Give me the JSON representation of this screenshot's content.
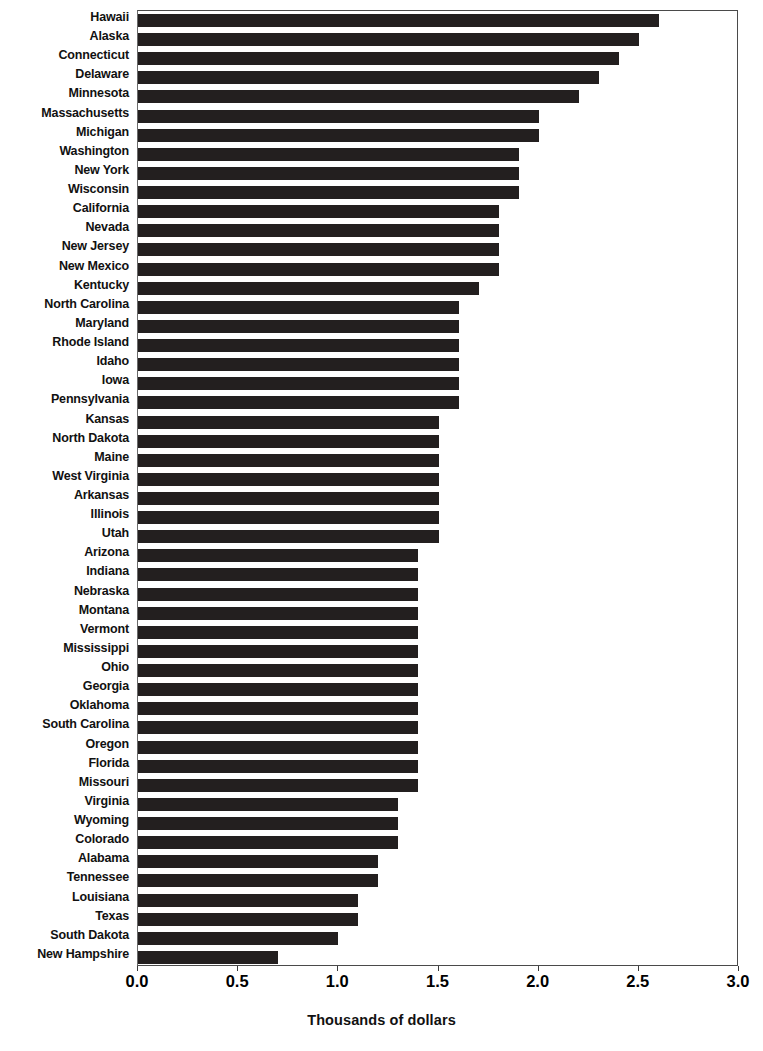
{
  "chart_data": {
    "type": "bar",
    "orientation": "horizontal",
    "title": "",
    "xlabel": "Thousands of dollars",
    "ylabel": "",
    "xlim": [
      0.0,
      3.0
    ],
    "xticks": [
      "0.0",
      "0.5",
      "1.0",
      "1.5",
      "2.0",
      "2.5",
      "3.0"
    ],
    "xtick_values": [
      0.0,
      0.5,
      1.0,
      1.5,
      2.0,
      2.5,
      3.0
    ],
    "grid": false,
    "legend": "none",
    "bar_color": "#231f1f",
    "categories": [
      "Hawaii",
      "Alaska",
      "Connecticut",
      "Delaware",
      "Minnesota",
      "Massachusetts",
      "Michigan",
      "Washington",
      "New York",
      "Wisconsin",
      "California",
      "Nevada",
      "New Jersey",
      "New Mexico",
      "Kentucky",
      "North Carolina",
      "Maryland",
      "Rhode Island",
      "Idaho",
      "Iowa",
      "Pennsylvania",
      "Kansas",
      "North Dakota",
      "Maine",
      "West Virginia",
      "Arkansas",
      "Illinois",
      "Utah",
      "Arizona",
      "Indiana",
      "Nebraska",
      "Montana",
      "Vermont",
      "Mississippi",
      "Ohio",
      "Georgia",
      "Oklahoma",
      "South Carolina",
      "Oregon",
      "Florida",
      "Missouri",
      "Virginia",
      "Wyoming",
      "Colorado",
      "Alabama",
      "Tennessee",
      "Louisiana",
      "Texas",
      "South Dakota",
      "New Hampshire"
    ],
    "values": [
      2.6,
      2.5,
      2.4,
      2.3,
      2.2,
      2.0,
      2.0,
      1.9,
      1.9,
      1.9,
      1.8,
      1.8,
      1.8,
      1.8,
      1.7,
      1.6,
      1.6,
      1.6,
      1.6,
      1.6,
      1.6,
      1.5,
      1.5,
      1.5,
      1.5,
      1.5,
      1.5,
      1.5,
      1.4,
      1.4,
      1.4,
      1.4,
      1.4,
      1.4,
      1.4,
      1.4,
      1.4,
      1.4,
      1.4,
      1.4,
      1.4,
      1.3,
      1.3,
      1.3,
      1.2,
      1.2,
      1.1,
      1.1,
      1.0,
      0.7
    ]
  }
}
